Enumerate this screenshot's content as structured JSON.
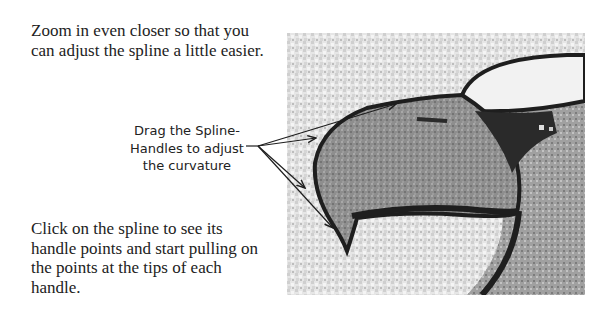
{
  "instructions": {
    "top_paragraph": "Zoom in even closer so that you can adjust the spline a little easier.",
    "bottom_paragraph": "Click on the spline to see its handle points and start pulling on the points at the tips of each handle."
  },
  "callout": {
    "lines": [
      "Drag the Spline-",
      "Handles to adjust",
      "the curvature"
    ]
  },
  "figure": {
    "colors": {
      "outline": "#1e1e1e",
      "beak_fill": "#8a8a8a",
      "background_noise": "#d8d8d8",
      "dark_shadow": "#2a2a2a"
    }
  }
}
